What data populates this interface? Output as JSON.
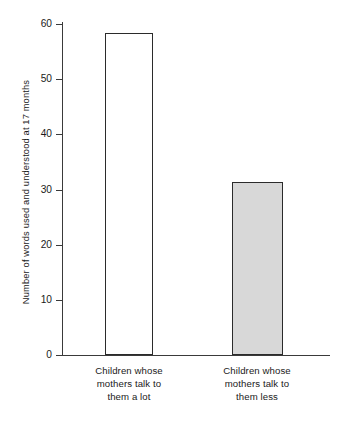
{
  "chart_data": {
    "type": "bar",
    "title": "",
    "subtitle": "",
    "xlabel": "",
    "ylabel": "Number of words used and understood at 17 months",
    "categories": [
      "Children whose mothers talk to them a lot",
      "Children whose mothers talk to them less"
    ],
    "category_lines": [
      [
        "Children whose",
        "mothers talk to",
        "them a lot"
      ],
      [
        "Children whose",
        "mothers talk to",
        "them less"
      ]
    ],
    "values": [
      58.3,
      31.3
    ],
    "ylim": [
      0,
      60
    ],
    "yticks": [
      0,
      10,
      20,
      30,
      40,
      50,
      60
    ],
    "ytick_labels": [
      "0",
      "10",
      "20",
      "30",
      "40",
      "50",
      "60"
    ],
    "grid": false,
    "legend": "none",
    "bar_fills": [
      "#ffffff",
      "#d8d8d8"
    ],
    "bar_edge_color": "#2b2b2b",
    "axis_color": "#3a3a3a",
    "background": "#ffffff"
  }
}
